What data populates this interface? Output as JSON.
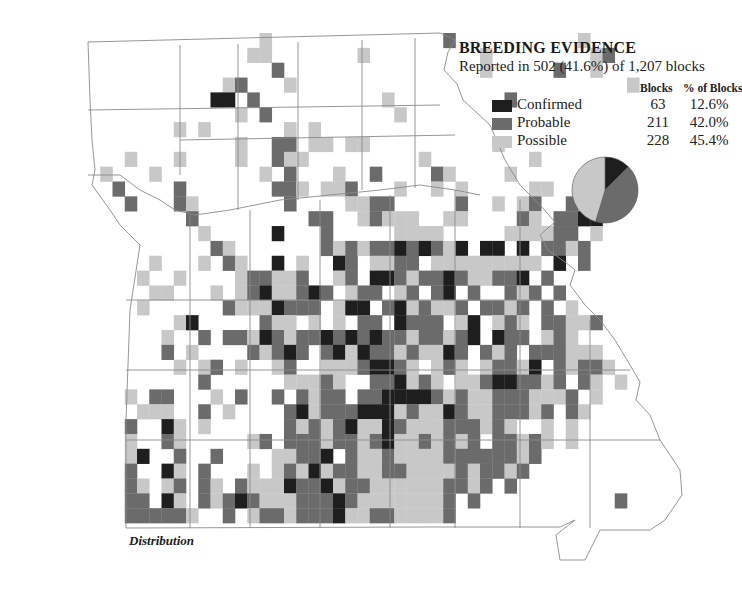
{
  "legend": {
    "title": "BREEDING EVIDENCE",
    "subtitle": "Reported in 502 (41.6%) of 1,207 blocks",
    "col_blocks": "Blocks",
    "col_pct": "% of Blocks",
    "rows": [
      {
        "label": "Confirmed",
        "blocks": "63",
        "pct": "12.6%",
        "color": "#1e1e1e"
      },
      {
        "label": "Probable",
        "blocks": "211",
        "pct": "42.0%",
        "color": "#6b6b6b"
      },
      {
        "label": "Possible",
        "blocks": "228",
        "pct": "45.4%",
        "color": "#c8c8c8"
      }
    ]
  },
  "caption": "Distribution",
  "colors": {
    "confirmed": "#1e1e1e",
    "probable": "#6b6b6b",
    "possible": "#c8c8c8",
    "border": "#8a8a8a"
  },
  "chart_data": {
    "type": "pie",
    "title": "BREEDING EVIDENCE",
    "subtitle": "Reported in 502 (41.6%) of 1,207 blocks",
    "categories": [
      "Confirmed",
      "Probable",
      "Possible"
    ],
    "values": [
      63,
      211,
      228
    ],
    "percentages": [
      12.6,
      42.0,
      45.4
    ],
    "total_reported": 502,
    "total_blocks": 1207,
    "legend_position": "top-right"
  },
  "grid": {
    "x0": 88,
    "y0": 33,
    "cw": 12.25,
    "ch": 14.85,
    "rows": [
      "..............s..............p..........s.....",
      ".............ss.......s.........s........sp...",
      "...............p................s.....p..s....",
      "...........sp...s...........................s.",
      "..........cc.p..........s.........p...........",
      "............s.p..........s....................",
      ".......s.s......s.s..........................",
      "............s..pp.ss.ss..........s..........",
      "...s...s....s..pss.........s........s........",
      ".s...s........s.p...s..p....ps....s...........",
      "..p....p.......pps.ssp...s..s.s.....ss......",
      "...p...ps.......p....sspp.....p..s.sp..p......",
      "........p.........pp..spsss..ss....ps.ppcc....",
      ".........s.....c...p.....ssss.....sssspp.s....",
      "..........ps.......pspsppcpcpsc.cc.c.ppsp.....",
      ".....s...s.ps..c.s..cp.sspp.sssssssss.c.p.....",
      "....s..s....sppssp..sp.ccpsppcpssppc.p........",
      ".....ss...s.spcsspcp.spp.sp.pc.p..psp.p........",
      "....s......pssscppp.scc.pcspssp.ppsp.p.s......",
      ".......sc.....pss.s.s.pp.cppp.sc.sps.ppssp.....",
      "......s..p.ppscpsppcpcpcppsppspc.cpp.sps.......",
      "......p.s....pspcp.pcscppspsscp.psp.pppsss.....",
      ".......s.sp.s..sp..ssspccps.sps.sppsc.pspps....",
      ".........p......sssps..ppcsps.sspccppsp.ps.s..",
      "...s.pp...s.p..p.pspp.ppccccpspsspppsssp.s....",
      "....sss..p.s....pcspppcccspsscpsspppsp.ps.....",
      "...p..cs.s......pspspcsscpssspppsps..s.s......",
      "...s..ps.....sp.pppsppspcsspspsp.ppsps.s.....",
      "...sc..p..p....ssppc.psspssssppppppsp.........",
      "...p..cs.p...s.spscsppssppsssspsppsp.........",
      "...ps.sp.ps.pssscppcsppssssssppsp.p.........",
      "...pp.cs.pspcpssspppcpsssssssp.p...........p.",
      "...ppppps..p.sppspppcssppssssp..............",
      "...............................................  "
    ]
  }
}
